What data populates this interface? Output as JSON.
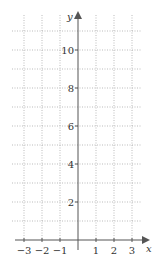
{
  "chart_data": {
    "type": "line",
    "title": "",
    "xlabel": "x",
    "ylabel": "y",
    "xlim": [
      -3,
      3
    ],
    "ylim": [
      0,
      11
    ],
    "x_ticks": [
      -3,
      -2,
      -1,
      1,
      2,
      3
    ],
    "y_ticks": [
      2,
      4,
      6,
      8,
      10
    ],
    "x_tick_labels": [
      "−3",
      "−2",
      "−1",
      "1",
      "2",
      "3"
    ],
    "y_tick_labels": [
      "2",
      "4",
      "6",
      "8",
      "10"
    ],
    "grid": true,
    "grid_style": "dotted",
    "grid_x_step": 1,
    "grid_y_step": 1,
    "series": []
  },
  "colors": {
    "axis": "#555555",
    "grid": "#aaaaaa",
    "text": "#333333"
  }
}
